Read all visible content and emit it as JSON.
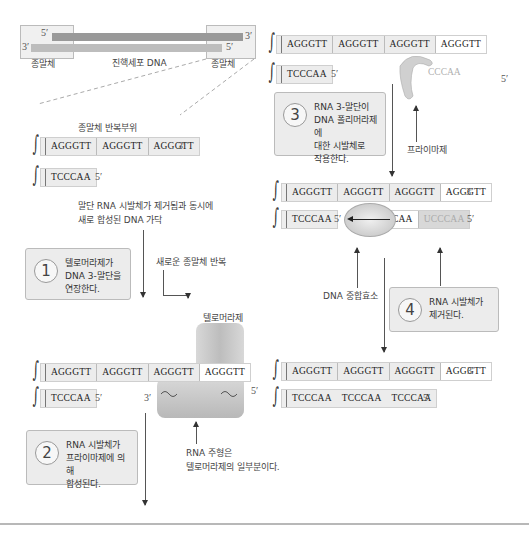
{
  "overview": {
    "dna_label": "진핵세포 DNA",
    "telomere_left_label": "종말체",
    "telomere_right_label": "종말체",
    "top_strand_left": "5′",
    "top_strand_right": "3′",
    "bottom_strand_left": "3′",
    "bottom_strand_right": "5′"
  },
  "panel1": {
    "repeat_label": "종말체 반복부위",
    "top_strand": [
      "AGGGTT",
      "AGGGTT",
      "AGGGTT"
    ],
    "top_end": "3′",
    "bottom_strand": [
      "TCCCAA"
    ],
    "bottom_end": "5′",
    "annotation_new_strand": "말단 RNA 시발체가 제거됨과 동시에\n새로 합성된 DNA 가닥"
  },
  "steps": [
    {
      "number": "1",
      "text": "텔로머라제가\nDNA 3-말단을\n연장한다."
    },
    {
      "number": "2",
      "text": "RNA 시발체가\n프라이마제에 의해\n합성된다."
    },
    {
      "number": "3",
      "text": "RNA 3-말단이\nDNA 폴리머라제에\n대한 시발체로\n작용한다."
    },
    {
      "number": "4",
      "text": "RNA 시발체가\n제거된다."
    }
  ],
  "panel2": {
    "new_repeat_label": "새로운 종말체 반복",
    "telomerase_label": "텔로머라제",
    "top_strand": [
      "AGGGTT",
      "AGGGTT",
      "AGGGTT",
      "AGGGTT"
    ],
    "bottom_strand": [
      "TCCCAA"
    ],
    "bottom_end": "5′",
    "rna_left": "3′",
    "rna_right": "5′",
    "rna_template_label": "RNA 주형은\n텔로머라제의 일부분이다."
  },
  "panel3": {
    "top_strand": [
      "AGGGTT",
      "AGGGTT",
      "AGGGTT",
      "AGGGTT"
    ],
    "bottom_strand": [
      "TCCCAA"
    ],
    "bottom_end": "5′",
    "primer_seq": "CCCAA",
    "far_end": "5′",
    "primase_label": "프라이마제"
  },
  "panel4": {
    "top_strand": [
      "AGGGTT",
      "AGGGTT",
      "AGGGTT",
      "AGGGTT"
    ],
    "top_end": "3′",
    "bottom_strand": [
      "TCCCAA"
    ],
    "bottom_mid_end": "5′",
    "partial_seq": "CAA",
    "primer_seq": "UCCCAA",
    "bottom_end": "5′",
    "polymerase_label": "DNA 중합효소"
  },
  "panel5": {
    "top_strand": [
      "AGGGTT",
      "AGGGTT",
      "AGGGTT",
      "AGGGTT"
    ],
    "top_end": "3′",
    "bottom_strand": [
      "TCCCAA",
      "TCCCAA",
      "TCCCAA"
    ],
    "bottom_end": "5′"
  }
}
